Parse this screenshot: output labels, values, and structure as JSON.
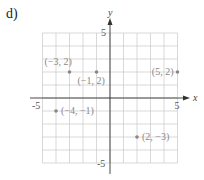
{
  "figure_label": "d)",
  "chart_data": {
    "type": "scatter",
    "title": "",
    "xlabel": "x",
    "ylabel": "y",
    "xlim": [
      -5,
      5
    ],
    "ylim": [
      -5,
      5
    ],
    "grid": true,
    "tick_labels": {
      "x": [
        "-5",
        "5"
      ],
      "y": [
        "5",
        "-5"
      ]
    },
    "points": [
      {
        "x": -3,
        "y": 2,
        "label": "(−3, 2)"
      },
      {
        "x": -1,
        "y": 2,
        "label": "(−1, 2)"
      },
      {
        "x": 5,
        "y": 2,
        "label": "(5, 2)"
      },
      {
        "x": -4,
        "y": -1,
        "label": "(−4, −1)"
      },
      {
        "x": 2,
        "y": -3,
        "label": "(2, −3)"
      }
    ],
    "point_color": "#888888"
  }
}
